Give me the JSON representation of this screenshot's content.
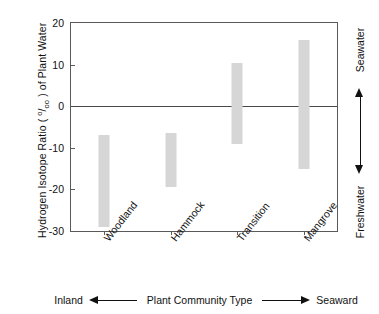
{
  "chart_data": {
    "type": "bar",
    "bar_style": "floating-range",
    "title": "",
    "xlabel": "Plant Community Type",
    "ylabel": "Hydrogen Isotope Ratio ( °/oo ) of Plant Water",
    "ylabel_parts": {
      "prefix": "Hydrogen Isotope Ratio ( ",
      "permil_numerator": "o",
      "permil_slash": "/",
      "permil_denominator": "oo",
      "suffix": " ) of Plant Water"
    },
    "categories": [
      "Woodland",
      "Hammock",
      "Transition",
      "Mangrove"
    ],
    "ranges": [
      {
        "category": "Woodland",
        "low": -29.0,
        "high": -7.0
      },
      {
        "category": "Hammock",
        "low": -19.5,
        "high": -6.5
      },
      {
        "category": "Transition",
        "low": -9.0,
        "high": 10.5
      },
      {
        "category": "Mangrove",
        "low": -15.0,
        "high": 16.0
      }
    ],
    "ylim": [
      -30,
      20
    ],
    "yticks": [
      20,
      10,
      0,
      -10,
      -20,
      -30
    ],
    "ytick_labels": [
      "20",
      "10",
      "0",
      "-10",
      "-20",
      "-30"
    ],
    "grid": false,
    "legend": null,
    "zero_line": true,
    "bar_color": "#d6d6d6",
    "axis_color": "#5a5a5a"
  },
  "axis_caption": {
    "left_word": "Inland",
    "center_text": "Plant Community Type",
    "right_word": "Seaward",
    "left_arrow_icon": "arrow-left-icon",
    "right_arrow_icon": "arrow-right-icon"
  },
  "right_annotation": {
    "top_word": "Seawater",
    "bottom_word": "Freshwater",
    "arrow_icon": "arrow-up-down-icon"
  }
}
